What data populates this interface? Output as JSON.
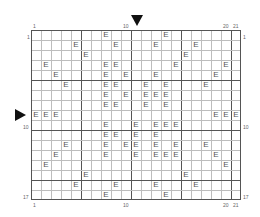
{
  "puzzle": {
    "columns": 21,
    "rows": 17,
    "cell_symbol": "E",
    "major_line_every": 5,
    "top_labels": [
      {
        "col": 1,
        "text": "1"
      },
      {
        "col": 10,
        "text": "10"
      },
      {
        "col": 20,
        "text": "20"
      },
      {
        "col": 21,
        "text": "21"
      }
    ],
    "bottom_labels": [
      {
        "col": 1,
        "text": "1"
      },
      {
        "col": 10,
        "text": "10"
      },
      {
        "col": 20,
        "text": "20"
      },
      {
        "col": 21,
        "text": "21"
      }
    ],
    "left_labels": [
      {
        "row": 1,
        "text": "1"
      },
      {
        "row": 10,
        "text": "10"
      },
      {
        "row": 17,
        "text": "17"
      }
    ],
    "right_labels": [
      {
        "row": 1,
        "text": "1"
      },
      {
        "row": 10,
        "text": "10"
      },
      {
        "row": 17,
        "text": "17"
      }
    ],
    "column_marker": {
      "col": 11,
      "symbol": "down-triangle"
    },
    "row_marker": {
      "row": 9,
      "symbol": "right-triangle"
    },
    "filled": [
      [
        8,
        14
      ],
      [
        5,
        9,
        13,
        17
      ],
      [
        6,
        16
      ],
      [
        2,
        8,
        9,
        15,
        20
      ],
      [
        3,
        8,
        10,
        13,
        19
      ],
      [
        4,
        8,
        9,
        12,
        14,
        18
      ],
      [
        8,
        10,
        12,
        13,
        14
      ],
      [
        8,
        9,
        12,
        14
      ],
      [
        1,
        2,
        3,
        19,
        20,
        21
      ],
      [
        8,
        11,
        13,
        14,
        15
      ],
      [
        8,
        9,
        11,
        13
      ],
      [
        4,
        8,
        10,
        11,
        13,
        15,
        18
      ],
      [
        3,
        8,
        11,
        13,
        14,
        15,
        19
      ],
      [
        2,
        20
      ],
      [
        6,
        16
      ],
      [
        5,
        9,
        13,
        17
      ],
      [
        8,
        14
      ]
    ]
  }
}
